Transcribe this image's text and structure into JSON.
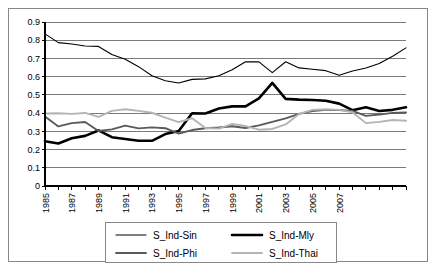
{
  "chart_data": {
    "type": "line",
    "title": "",
    "subtitle": "",
    "xlabel": "",
    "ylabel": "",
    "ylim": [
      0,
      0.9
    ],
    "ytick_labels": [
      "0.9",
      "0.8",
      "0.7",
      "0.6",
      "0.5",
      "0.4",
      "0.3",
      "0.2",
      "0.1",
      "0"
    ],
    "ytick_values": [
      0.9,
      0.8,
      0.7,
      0.6,
      0.5,
      0.4,
      0.3,
      0.2,
      0.1,
      0
    ],
    "grid": true,
    "legend_position": "bottom",
    "x": [
      1985,
      1986,
      1987,
      1988,
      1989,
      1990,
      1991,
      1992,
      1993,
      1994,
      1995,
      1996,
      1997,
      1998,
      1999,
      2000,
      2001,
      2002,
      2003,
      2004,
      2005,
      2006,
      2007,
      2008
    ],
    "xtick_labels": [
      "1985",
      "",
      "1987",
      "",
      "1989",
      "",
      "1991",
      "",
      "1993",
      "",
      "1995",
      "",
      "1997",
      "",
      "1999",
      "",
      "2001",
      "",
      "2003",
      "",
      "2005",
      "",
      "2007",
      ""
    ],
    "series": [
      {
        "name": "S_Ind-Sin",
        "color": "#000000",
        "width": 1.1,
        "values": [
          0.835,
          0.787,
          0.779,
          0.768,
          0.766,
          0.722,
          0.695,
          0.655,
          0.605,
          0.578,
          0.565,
          0.585,
          0.588,
          0.605,
          0.638,
          0.682,
          0.681,
          0.622,
          0.682,
          0.648,
          0.641,
          0.633,
          0.608,
          0.631
        ]
      },
      {
        "name": "S_Ind-Mly",
        "color": "#000000",
        "width": 2.6,
        "values": [
          0.246,
          0.233,
          0.262,
          0.275,
          0.305,
          0.268,
          0.258,
          0.248,
          0.248,
          0.285,
          0.302,
          0.399,
          0.398,
          0.425,
          0.437,
          0.437,
          0.481,
          0.566,
          0.478,
          0.474,
          0.472,
          0.468,
          0.452,
          0.416
        ]
      },
      {
        "name": "S_Ind-Phi",
        "color": "#5a5a5a",
        "width": 1.9,
        "values": [
          0.381,
          0.327,
          0.345,
          0.351,
          0.302,
          0.311,
          0.331,
          0.316,
          0.322,
          0.317,
          0.288,
          0.307,
          0.317,
          0.321,
          0.328,
          0.318,
          0.333,
          0.352,
          0.371,
          0.396,
          0.411,
          0.418,
          0.417,
          0.412
        ]
      },
      {
        "name": "S_Ind-Thai",
        "color": "#b4b4b4",
        "width": 1.9,
        "values": [
          0.398,
          0.399,
          0.396,
          0.401,
          0.379,
          0.412,
          0.421,
          0.412,
          0.402,
          0.375,
          0.351,
          0.372,
          0.318,
          0.315,
          0.341,
          0.329,
          0.309,
          0.313,
          0.338,
          0.395,
          0.418,
          0.421,
          0.418,
          0.405
        ]
      }
    ],
    "series_extended_notes": {
      "S_Ind-Sin_tail": [
        0.631,
        0.648,
        0.672,
        0.712,
        0.758
      ],
      "S_Ind-Mly_tail": [
        0.416,
        0.432,
        0.412,
        0.418,
        0.432
      ],
      "S_Ind-Phi_tail": [
        0.412,
        0.385,
        0.392,
        0.401,
        0.403
      ],
      "S_Ind-Thai_tail": [
        0.405,
        0.345,
        0.352,
        0.362,
        0.358
      ]
    }
  },
  "legend": {
    "items": [
      {
        "label": "S_Ind-Sin"
      },
      {
        "label": "S_Ind-Mly"
      },
      {
        "label": "S_Ind-Phi"
      },
      {
        "label": "S_Ind-Thai"
      }
    ]
  }
}
